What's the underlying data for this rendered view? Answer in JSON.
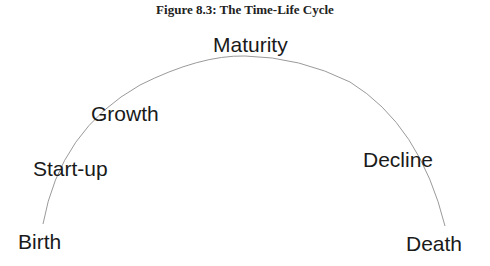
{
  "figure": {
    "title": "Figure 8.3: The Time-Life Cycle"
  },
  "stages": [
    {
      "label": "Birth"
    },
    {
      "label": "Start-up"
    },
    {
      "label": "Growth"
    },
    {
      "label": "Maturity"
    },
    {
      "label": "Decline"
    },
    {
      "label": "Death"
    }
  ],
  "colors": {
    "arc": "#9a9a9a",
    "text": "#1a1a1a"
  }
}
